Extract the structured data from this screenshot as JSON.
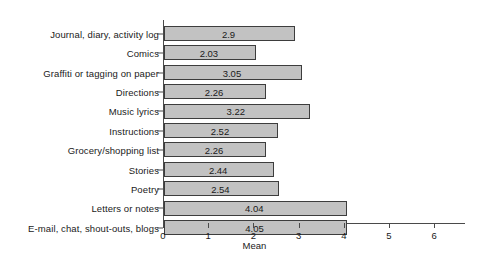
{
  "chart_data": {
    "type": "bar",
    "orientation": "horizontal",
    "title": "",
    "xlabel": "Mean",
    "ylabel": "",
    "xlim": [
      0,
      6.65
    ],
    "xticks": [
      0,
      1,
      2,
      3,
      4,
      5,
      6
    ],
    "xtick_labels": [
      "0",
      "1",
      "2",
      "3",
      "4",
      "5",
      "6"
    ],
    "grid": false,
    "legend": false,
    "bar_color": "#c2c2c2",
    "bar_edge_color": "#3d3d3d",
    "axis_color": "#4a4a4a",
    "categories": [
      "Journal, diary, activity log",
      "Comics",
      "Graffiti or tagging on paper",
      "Directions",
      "Music lyrics",
      "Instructions",
      "Grocery/shopping list",
      "Stories",
      "Poetry",
      "Letters or notes",
      "E-mail, chat, shout-outs, blogs"
    ],
    "values": [
      2.9,
      2.03,
      3.05,
      2.26,
      3.22,
      2.52,
      2.26,
      2.44,
      2.54,
      4.04,
      4.05
    ],
    "value_labels": [
      "2.9",
      "2.03",
      "3.05",
      "2.26",
      "3.22",
      "2.52",
      "2.26",
      "2.44",
      "2.54",
      "4.04",
      "4.05"
    ]
  }
}
